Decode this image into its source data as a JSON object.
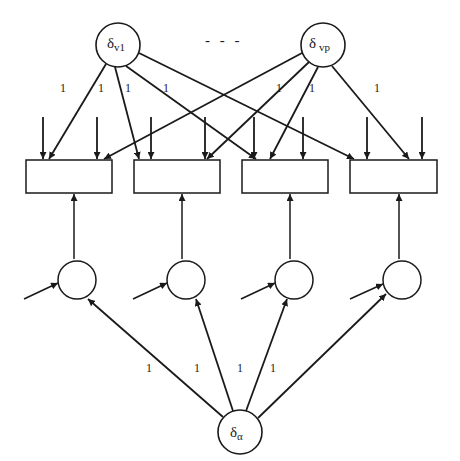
{
  "diagram": {
    "type": "path-diagram",
    "top_nodes": [
      {
        "id": "delta_v1",
        "symbol": "δ",
        "subscript": "v1",
        "cx": 118,
        "cy": 45,
        "r": 22
      },
      {
        "id": "delta_vp",
        "symbol": "δ",
        "subscript": "vp",
        "cx": 323,
        "cy": 45,
        "r": 22
      }
    ],
    "ellipsis": "- - -",
    "boxes": [
      {
        "id": "box1",
        "x": 26,
        "y": 160,
        "w": 86,
        "h": 33
      },
      {
        "id": "box2",
        "x": 134,
        "y": 160,
        "w": 86,
        "h": 33
      },
      {
        "id": "box3",
        "x": 242,
        "y": 160,
        "w": 86,
        "h": 33
      },
      {
        "id": "box4",
        "x": 350,
        "y": 160,
        "w": 87,
        "h": 33
      }
    ],
    "mid_nodes": [
      {
        "id": "c1",
        "cx": 77,
        "cy": 278,
        "r": 19
      },
      {
        "id": "c2",
        "cx": 186,
        "cy": 278,
        "r": 19
      },
      {
        "id": "c3",
        "cx": 294,
        "cy": 278,
        "r": 19
      },
      {
        "id": "c4",
        "cx": 402,
        "cy": 278,
        "r": 19
      }
    ],
    "bottom_node": {
      "id": "delta_alpha",
      "symbol": "δ",
      "subscript": "α",
      "cx": 240,
      "cy": 432,
      "r": 22
    },
    "top_edge_labels": [
      {
        "text": "1",
        "x": 60,
        "y": 92
      },
      {
        "text": "1",
        "x": 100,
        "y": 92
      },
      {
        "text": "1",
        "x": 126,
        "y": 92
      },
      {
        "text": "1",
        "x": 164,
        "y": 92
      },
      {
        "text": "1",
        "x": 278,
        "y": 92
      },
      {
        "text": "1",
        "x": 310,
        "y": 92
      },
      {
        "text": "1",
        "x": 375,
        "y": 92
      }
    ],
    "bottom_edge_labels": [
      {
        "text": "1",
        "x": 148,
        "y": 372
      },
      {
        "text": "1",
        "x": 196,
        "y": 372
      },
      {
        "text": "1",
        "x": 238,
        "y": 372
      },
      {
        "text": "1",
        "x": 271,
        "y": 372
      }
    ],
    "stroke_color": "#1a1a1a",
    "background": "#ffffff"
  }
}
